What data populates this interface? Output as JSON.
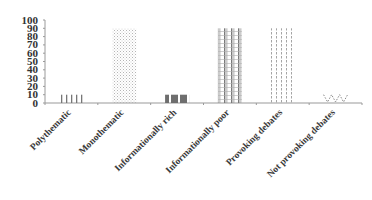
{
  "chart_data": {
    "type": "bar",
    "title": "",
    "xlabel": "",
    "ylabel": "",
    "ylim": [
      0,
      100
    ],
    "yticks": [
      0,
      10,
      20,
      30,
      40,
      50,
      60,
      70,
      80,
      90,
      100
    ],
    "grid": false,
    "legend": null,
    "categories": [
      "Polythematic",
      "Monothematic",
      "Informationally rich",
      "Informationally poor",
      "Provoking debates",
      "Not provoking debates"
    ],
    "values": [
      10,
      90,
      10,
      90,
      90,
      10
    ],
    "patterns": [
      "vertical-ticks",
      "light-dots",
      "dark-blocks",
      "vertical-stripes-dense",
      "vertical-dashed",
      "zigzag-dots"
    ]
  },
  "colors": {
    "axis": "#9a9a9a",
    "text": "#333333",
    "bar_dark": "#6a6a6a",
    "bar_light": "#c8c8c8"
  }
}
